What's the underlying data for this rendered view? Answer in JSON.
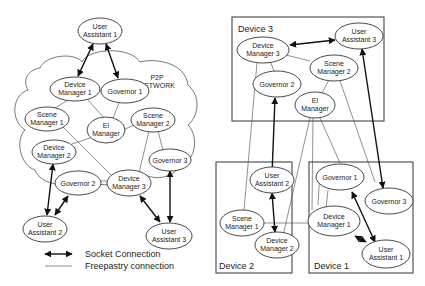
{
  "left_diagram": {
    "network_label": [
      "P2P",
      "NETWORK"
    ],
    "nodes": {
      "ua1": [
        "User",
        "Assistant 1"
      ],
      "dm1": [
        "Device",
        "Manager 1"
      ],
      "gov1": [
        "Governor 1"
      ],
      "sm1": [
        "Scene",
        "Manager 1"
      ],
      "eim": [
        "EI",
        "Manager"
      ],
      "sm2": [
        "Scene",
        "Manager 2"
      ],
      "dm2": [
        "Device",
        "Manager 2"
      ],
      "gov3": [
        "Governor 3"
      ],
      "gov2": [
        "Governor 2"
      ],
      "dm3": [
        "Device",
        "Manager 3"
      ],
      "ua2": [
        "User",
        "Assistant 2"
      ],
      "ua3": [
        "User",
        "Assistant 3"
      ]
    }
  },
  "right_diagram": {
    "devices": {
      "device3": "Device 3",
      "device2": "Device 2",
      "device1": "Device 1"
    },
    "nodes": {
      "dm3": [
        "Device",
        "Manager 3"
      ],
      "ua3": [
        "User",
        "Assistant 3"
      ],
      "sm2": [
        "Scene",
        "Manager 2"
      ],
      "gov2": [
        "Governor 2"
      ],
      "eim": [
        "EI",
        "Manager"
      ],
      "ua2": [
        "User",
        "Assistant 2"
      ],
      "sm1": [
        "Scene",
        "Manager 1"
      ],
      "dm2": [
        "Device",
        "Manager 2"
      ],
      "gov1": [
        "Governor 1"
      ],
      "gov3": [
        "Governor 3"
      ],
      "dm1": [
        "Device",
        "Manager 1"
      ],
      "ua1": [
        "User",
        "Assistant 1"
      ]
    }
  },
  "legend": {
    "socket": "Socket Connection",
    "freepastry": "Freepastry connection"
  },
  "colors": {
    "line": "#444444",
    "arrow": "#111111",
    "background": "#ffffff"
  }
}
